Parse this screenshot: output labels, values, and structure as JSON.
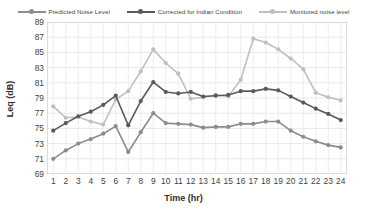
{
  "chart_data": {
    "type": "line",
    "title": "",
    "xlabel": "Time (hr)",
    "ylabel": "Leq (dB)",
    "x": [
      1,
      2,
      3,
      4,
      5,
      6,
      7,
      8,
      9,
      10,
      11,
      12,
      13,
      14,
      15,
      16,
      17,
      18,
      19,
      20,
      21,
      22,
      23,
      24
    ],
    "xticklabels": [
      "1",
      "2",
      "3",
      "4",
      "5",
      "6",
      "7",
      "8",
      "9",
      "10",
      "11",
      "12",
      "13",
      "14",
      "15",
      "16",
      "17",
      "18",
      "19",
      "20",
      "21",
      "22",
      "23",
      "24"
    ],
    "xlim": [
      0.5,
      24.5
    ],
    "ylim": [
      69,
      89
    ],
    "yticks": [
      69,
      71,
      73,
      75,
      77,
      79,
      81,
      83,
      85,
      87,
      89
    ],
    "grid": true,
    "legend_position": "top-center",
    "series": [
      {
        "name": "Predicted Noise Level",
        "color": "#8c8c8c",
        "marker": "circle",
        "values": [
          71.0,
          72.1,
          73.0,
          73.6,
          74.3,
          75.3,
          71.9,
          74.5,
          77.0,
          75.7,
          75.6,
          75.5,
          75.1,
          75.2,
          75.2,
          75.6,
          75.6,
          75.9,
          75.9,
          74.7,
          73.9,
          73.3,
          72.8,
          72.5
        ]
      },
      {
        "name": "Corrected for Indian Condition",
        "color": "#5a5a5a",
        "marker": "circle",
        "values": [
          74.7,
          75.7,
          76.6,
          77.2,
          78.1,
          79.3,
          75.4,
          78.6,
          81.1,
          79.8,
          79.6,
          79.8,
          79.2,
          79.3,
          79.4,
          79.9,
          79.9,
          80.2,
          80.0,
          79.2,
          78.4,
          77.6,
          76.9,
          76.1
        ]
      },
      {
        "name": "Monitored noise level",
        "color": "#bfbfbf",
        "marker": "circle",
        "values": [
          77.9,
          76.4,
          76.5,
          75.9,
          75.5,
          78.8,
          79.9,
          82.5,
          85.4,
          83.6,
          82.2,
          78.9,
          79.1,
          79.4,
          79.2,
          81.4,
          86.8,
          86.3,
          85.4,
          84.2,
          82.8,
          79.7,
          79.1,
          78.7
        ]
      }
    ]
  },
  "legend": {
    "items": [
      {
        "label": "Predicted Noise Level",
        "color": "#8c8c8c"
      },
      {
        "label": "Corrected for Indian Condition",
        "color": "#5a5a5a"
      },
      {
        "label": "Monitored noise level",
        "color": "#bfbfbf"
      }
    ]
  },
  "axes": {
    "x_title": "Time (hr)",
    "y_title": "Leq (dB)"
  }
}
